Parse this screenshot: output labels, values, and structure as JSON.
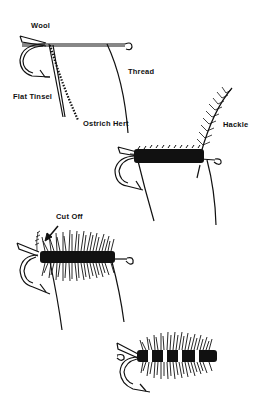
{
  "colors": {
    "ink": "#111111",
    "background": "#ffffff"
  },
  "steps": [
    {
      "id": 1,
      "labels": {
        "wool": "Wool",
        "flat_tinsel": "Flat Tinsel",
        "thread": "Thread",
        "ostrich_herl": "Ostrich Hert"
      }
    },
    {
      "id": 2,
      "labels": {
        "hackle": "Hackle"
      }
    },
    {
      "id": 3,
      "labels": {
        "cut_off": "Cut Off"
      }
    },
    {
      "id": 4,
      "labels": {}
    }
  ]
}
